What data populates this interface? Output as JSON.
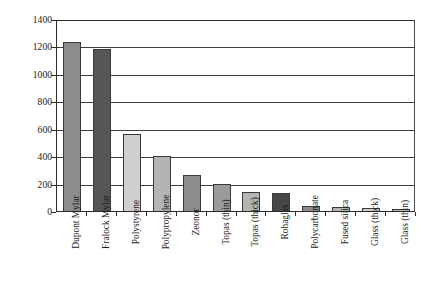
{
  "chart_data": {
    "type": "bar",
    "title": "",
    "subtitle": "",
    "xlabel": "",
    "ylabel": "Initial intensity/counts",
    "ylim": [
      0,
      1400
    ],
    "ytick_step": 200,
    "yticks": [
      1400,
      1200,
      1000,
      800,
      600,
      400,
      200,
      0
    ],
    "ytick_labels": [
      "1400",
      "1200",
      "1000",
      "800",
      "600",
      "400",
      "200",
      "0"
    ],
    "grid": "horizontal",
    "legend": "none",
    "categories": [
      "Dupont Mylar",
      "Fralock Mylar",
      "Polystyrene",
      "Polypropylene",
      "Zeonor",
      "Topas (thin)",
      "Topas (thick)",
      "Rohaglas",
      "Polycarbonate",
      "Fused silica",
      "Glass (thick)",
      "Glass (thin)"
    ],
    "values": [
      1230,
      1180,
      565,
      400,
      265,
      200,
      140,
      130,
      35,
      30,
      20,
      18
    ],
    "bar_colors": [
      "#8c8c8c",
      "#565656",
      "#cfcfcf",
      "#b4b4b4",
      "#8c8c8c",
      "#9a9a9a",
      "#b4b4b4",
      "#474747",
      "#8c8c8c",
      "#b4b4b4",
      "#cfcfcf",
      "#b4b4b4"
    ],
    "bar_edge_color": "#3a3a3a",
    "axis_color": "#2b2b2b",
    "gridline_color": "#3d3d3d",
    "background_color": "#ffffff"
  }
}
